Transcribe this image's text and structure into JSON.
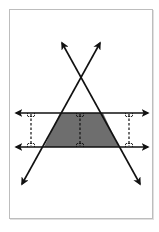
{
  "diagram": {
    "colors": {
      "line": "#111111",
      "shade": "#6e6e6e",
      "frame": "#bdbdbd",
      "background": "#ffffff"
    },
    "parallel_lines": [
      {
        "name": "upper-parallel",
        "y": 113,
        "x_start": 16,
        "x_end": 148
      },
      {
        "name": "lower-parallel",
        "y": 147,
        "x_start": 16,
        "x_end": 148
      }
    ],
    "transversals": [
      {
        "name": "rising-line",
        "from": [
          22,
          184
        ],
        "to": [
          100,
          43
        ]
      },
      {
        "name": "falling-line",
        "from": [
          62,
          43
        ],
        "to": [
          140,
          184
        ]
      }
    ],
    "trapezoid": [
      [
        60,
        113
      ],
      [
        103,
        113
      ],
      [
        119,
        147
      ],
      [
        44,
        147
      ]
    ],
    "perpendicular_segments": [
      {
        "x": 31
      },
      {
        "x": 80
      },
      {
        "x": 129
      }
    ]
  }
}
